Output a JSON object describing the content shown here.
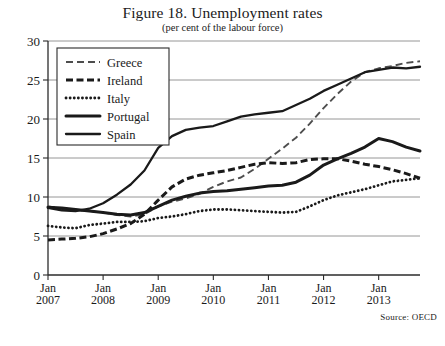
{
  "title": "Figure 18. Unemployment rates",
  "subtitle": "(per cent of the labour force)",
  "source": "Source: OECD",
  "legend": {
    "items": [
      {
        "label": "Greece",
        "style": "thin-dashed"
      },
      {
        "label": "Ireland",
        "style": "thick-dashed"
      },
      {
        "label": "Italy",
        "style": "dotted"
      },
      {
        "label": "Portugal",
        "style": "thick-solid"
      },
      {
        "label": "Spain",
        "style": "medium-solid"
      }
    ]
  },
  "axes": {
    "y_ticks": [
      "0",
      "5",
      "10",
      "15",
      "20",
      "25",
      "30"
    ],
    "x_ticks": [
      {
        "month": "Jan",
        "year": "2007"
      },
      {
        "month": "Jan",
        "year": "2008"
      },
      {
        "month": "Jan",
        "year": "2009"
      },
      {
        "month": "Jan",
        "year": "2010"
      },
      {
        "month": "Jan",
        "year": "2011"
      },
      {
        "month": "Jan",
        "year": "2012"
      },
      {
        "month": "Jan",
        "year": "2013"
      }
    ]
  },
  "chart_data": {
    "type": "line",
    "title": "Figure 18. Unemployment rates",
    "subtitle": "(per cent of the labour force)",
    "xlabel": "",
    "ylabel": "",
    "ylim": [
      0,
      30
    ],
    "yticks": [
      0,
      5,
      10,
      15,
      20,
      25,
      30
    ],
    "grid": true,
    "legend_position": "top-left",
    "source": "Source: OECD",
    "x": [
      "2007-01",
      "2007-04",
      "2007-07",
      "2007-10",
      "2008-01",
      "2008-04",
      "2008-07",
      "2008-10",
      "2009-01",
      "2009-04",
      "2009-07",
      "2009-10",
      "2010-01",
      "2010-04",
      "2010-07",
      "2010-10",
      "2011-01",
      "2011-04",
      "2011-07",
      "2011-10",
      "2012-01",
      "2012-04",
      "2012-07",
      "2012-10",
      "2013-01",
      "2013-04",
      "2013-07",
      "2013-10"
    ],
    "xlim": [
      "2007-01",
      "2013-12"
    ],
    "series": [
      {
        "name": "Greece",
        "style": "thin-dashed",
        "color": "#4d4d4d",
        "values": [
          8.8,
          8.5,
          8.3,
          8.2,
          8.0,
          7.7,
          7.5,
          7.8,
          8.8,
          9.4,
          9.8,
          10.4,
          11.3,
          12.0,
          12.5,
          13.6,
          14.9,
          16.2,
          17.6,
          19.4,
          21.4,
          23.2,
          24.8,
          26.0,
          26.5,
          26.8,
          27.2,
          27.4
        ]
      },
      {
        "name": "Ireland",
        "style": "thick-dashed",
        "color": "#1a1a1a",
        "values": [
          4.5,
          4.6,
          4.7,
          4.9,
          5.3,
          5.9,
          6.6,
          7.8,
          9.6,
          11.3,
          12.3,
          12.8,
          13.1,
          13.4,
          13.8,
          14.2,
          14.4,
          14.3,
          14.4,
          14.8,
          14.9,
          14.9,
          14.6,
          14.2,
          13.9,
          13.5,
          13.0,
          12.4
        ]
      },
      {
        "name": "Italy",
        "style": "dotted",
        "color": "#1a1a1a",
        "values": [
          6.3,
          6.1,
          6.0,
          6.4,
          6.6,
          6.8,
          6.8,
          6.9,
          7.3,
          7.5,
          7.8,
          8.2,
          8.4,
          8.4,
          8.3,
          8.2,
          8.1,
          8.0,
          8.1,
          8.8,
          9.6,
          10.2,
          10.6,
          11.0,
          11.5,
          12.0,
          12.2,
          12.4
        ]
      },
      {
        "name": "Portugal",
        "style": "thick-solid",
        "color": "#1a1a1a",
        "values": [
          8.7,
          8.6,
          8.4,
          8.2,
          8.0,
          7.8,
          7.7,
          8.0,
          8.8,
          9.6,
          10.1,
          10.5,
          10.7,
          10.8,
          11.0,
          11.2,
          11.4,
          11.5,
          11.9,
          12.8,
          14.1,
          14.9,
          15.6,
          16.4,
          17.5,
          17.1,
          16.4,
          15.9
        ]
      },
      {
        "name": "Spain",
        "style": "medium-solid",
        "color": "#1a1a1a",
        "values": [
          8.6,
          8.3,
          8.2,
          8.5,
          9.2,
          10.3,
          11.6,
          13.4,
          16.3,
          17.8,
          18.6,
          18.9,
          19.1,
          19.7,
          20.3,
          20.6,
          20.8,
          21.0,
          21.8,
          22.6,
          23.6,
          24.4,
          25.2,
          26.0,
          26.3,
          26.6,
          26.5,
          26.7
        ]
      }
    ]
  }
}
